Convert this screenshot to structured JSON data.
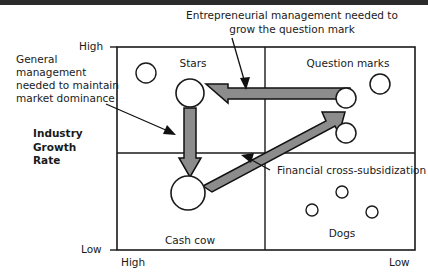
{
  "diagram": {
    "type": "bcg-growth-share-matrix",
    "title_bold_label": "Industry\nGrowth\nRate",
    "x_axis": {
      "label_left": "High",
      "label_right": "Low"
    },
    "y_axis": {
      "label_top": "High",
      "label_bottom": "Low"
    },
    "quadrants": [
      {
        "key": "stars",
        "label": "Stars",
        "position": "top-left"
      },
      {
        "key": "question-marks",
        "label": "Question marks",
        "position": "top-right"
      },
      {
        "key": "cash-cow",
        "label": "Cash cow",
        "position": "bottom-left"
      },
      {
        "key": "dogs",
        "label": "Dogs",
        "position": "bottom-right"
      }
    ],
    "annotations": [
      {
        "key": "entrepreneurial",
        "line1": "Entrepreneurial management needed to",
        "line2": "grow the question mark"
      },
      {
        "key": "general-management",
        "line1": "General",
        "line2": "management",
        "line3": "needed to maintain",
        "line4": "market dominance"
      },
      {
        "key": "financial-cross-subsidization",
        "line1": "Financial cross-subsidization"
      }
    ],
    "flows": [
      {
        "key": "question-mark-to-star",
        "direction": "right-to-left",
        "note": "grow the question mark"
      },
      {
        "key": "star-to-cash-cow",
        "direction": "top-to-bottom",
        "note": "maintain market dominance"
      },
      {
        "key": "cash-cow-to-question",
        "direction": "diagonal-up-right",
        "note": "financial cross-subsidization"
      }
    ],
    "colors": {
      "arrow_fill": "#8c8c8c",
      "arrow_stroke": "#000000",
      "frame": "#1a1a1a",
      "bubble_stroke": "#1a1a1a",
      "text": "#1a1a1a",
      "top_bar": "#2b2b2b"
    }
  }
}
